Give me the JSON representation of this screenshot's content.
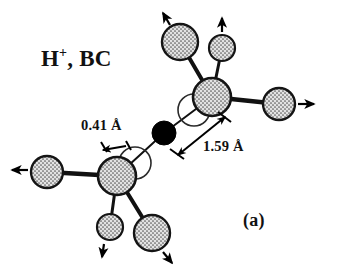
{
  "figure": {
    "panel_label": "(a)",
    "species_label": {
      "element": "H",
      "charge": "+",
      "site": ", BC",
      "full_text": "H+, BC"
    },
    "background_color": "#ffffff",
    "line_color": "#111111"
  },
  "dimensions": [
    {
      "id": "displacement",
      "value": "0.41 Å",
      "describes": "host-atom outward displacement from ideal lattice site"
    },
    {
      "id": "bond-length",
      "value": "1.59 Å",
      "describes": "distance from bond-centered hydrogen to host atom"
    }
  ],
  "atoms": {
    "impurity": {
      "name": "hydrogen",
      "style": "filled-black",
      "color": "#000000",
      "cx": 164,
      "cy": 133,
      "r": 12
    },
    "hosts": [
      {
        "id": "host-upper",
        "cx": 212,
        "cy": 97,
        "r": 19
      },
      {
        "id": "host-lower",
        "cx": 117,
        "cy": 176,
        "r": 19
      }
    ],
    "neighbors": [
      {
        "id": "neighbor-upper-left",
        "cx": 180,
        "cy": 42,
        "r": 18,
        "arrow_dir": "up-left"
      },
      {
        "id": "neighbor-upper-mid",
        "cx": 222,
        "cy": 48,
        "r": 13,
        "arrow_dir": "up"
      },
      {
        "id": "neighbor-upper-right",
        "cx": 279,
        "cy": 104,
        "r": 16,
        "arrow_dir": "right"
      },
      {
        "id": "neighbor-lower-left",
        "cx": 47,
        "cy": 172,
        "r": 16,
        "arrow_dir": "left"
      },
      {
        "id": "neighbor-lower-mid",
        "cx": 110,
        "cy": 227,
        "r": 13,
        "arrow_dir": "down"
      },
      {
        "id": "neighbor-lower-right",
        "cx": 152,
        "cy": 233,
        "r": 18,
        "arrow_dir": "down-right"
      }
    ],
    "ideal_site_outlines": [
      {
        "id": "ideal-site-upper",
        "cx": 194,
        "cy": 110,
        "r": 16
      },
      {
        "id": "ideal-site-lower",
        "cx": 135,
        "cy": 163,
        "r": 16
      }
    ]
  },
  "colors": {
    "atom_outline": "#141414",
    "atom_fill": "#d8d8d8",
    "bond": "#111111",
    "arrow": "#000000",
    "ideal_outline": "#2a2a2a"
  }
}
